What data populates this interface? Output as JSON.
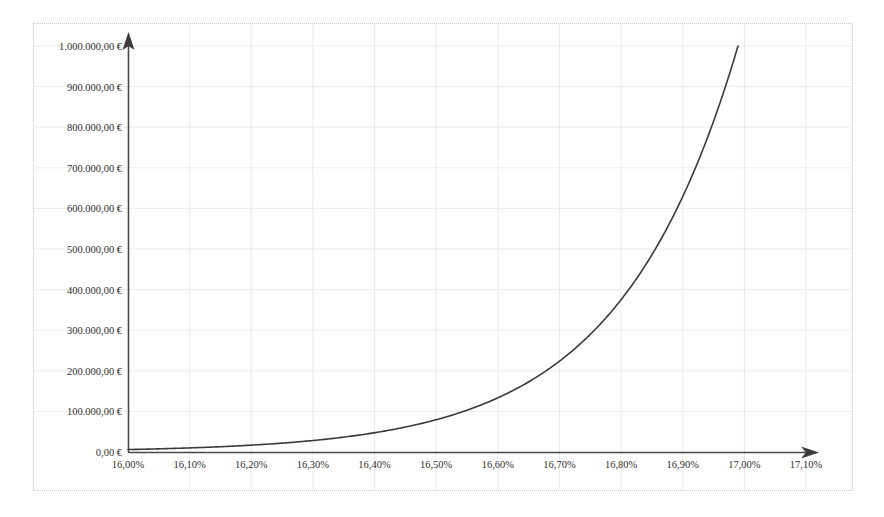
{
  "chart_data": {
    "type": "line",
    "title": "",
    "subtitle": "",
    "xlabel": "",
    "ylabel": "",
    "grid": true,
    "legend": false,
    "legend_position": "none",
    "x_tick_labels": [
      "16,00%",
      "16,10%",
      "16,20%",
      "16,30%",
      "16,40%",
      "16,50%",
      "16,60%",
      "16,70%",
      "16,80%",
      "16,90%",
      "17,00%",
      "17,10%"
    ],
    "y_tick_labels": [
      "0,00 €",
      "100.000,00 €",
      "200.000,00 €",
      "300.000,00 €",
      "400.000,00 €",
      "500.000,00 €",
      "600.000,00 €",
      "700.000,00 €",
      "800.000,00 €",
      "900.000,00 €",
      "1.000.000,00 €"
    ],
    "x_tick_values": [
      16.0,
      16.1,
      16.2,
      16.3,
      16.4,
      16.5,
      16.6,
      16.7,
      16.8,
      16.9,
      17.0,
      17.1
    ],
    "y_tick_values": [
      0,
      100000,
      200000,
      300000,
      400000,
      500000,
      600000,
      700000,
      800000,
      900000,
      1000000
    ],
    "xlim": [
      16.0,
      17.1
    ],
    "ylim": [
      0,
      1000000
    ],
    "line_color": "#3a3a3a",
    "axis_color": "#4a4a4a",
    "grid_color": "#ebebeb",
    "border_color": "#c9c9c9",
    "series": [
      {
        "name": "value",
        "x": [
          16.0,
          16.05,
          16.1,
          16.15,
          16.2,
          16.25,
          16.3,
          16.35,
          16.4,
          16.45,
          16.5,
          16.55,
          16.6,
          16.65,
          16.7,
          16.75,
          16.8,
          16.85,
          16.9,
          16.95,
          17.0,
          17.05
        ],
        "values": [
          6000,
          8000,
          11000,
          14500,
          19000,
          25000,
          32000,
          41000,
          53000,
          68000,
          88000,
          113000,
          145000,
          186000,
          239000,
          306000,
          393000,
          504000,
          647000,
          830000,
          1065000,
          1366000
        ]
      }
    ]
  }
}
